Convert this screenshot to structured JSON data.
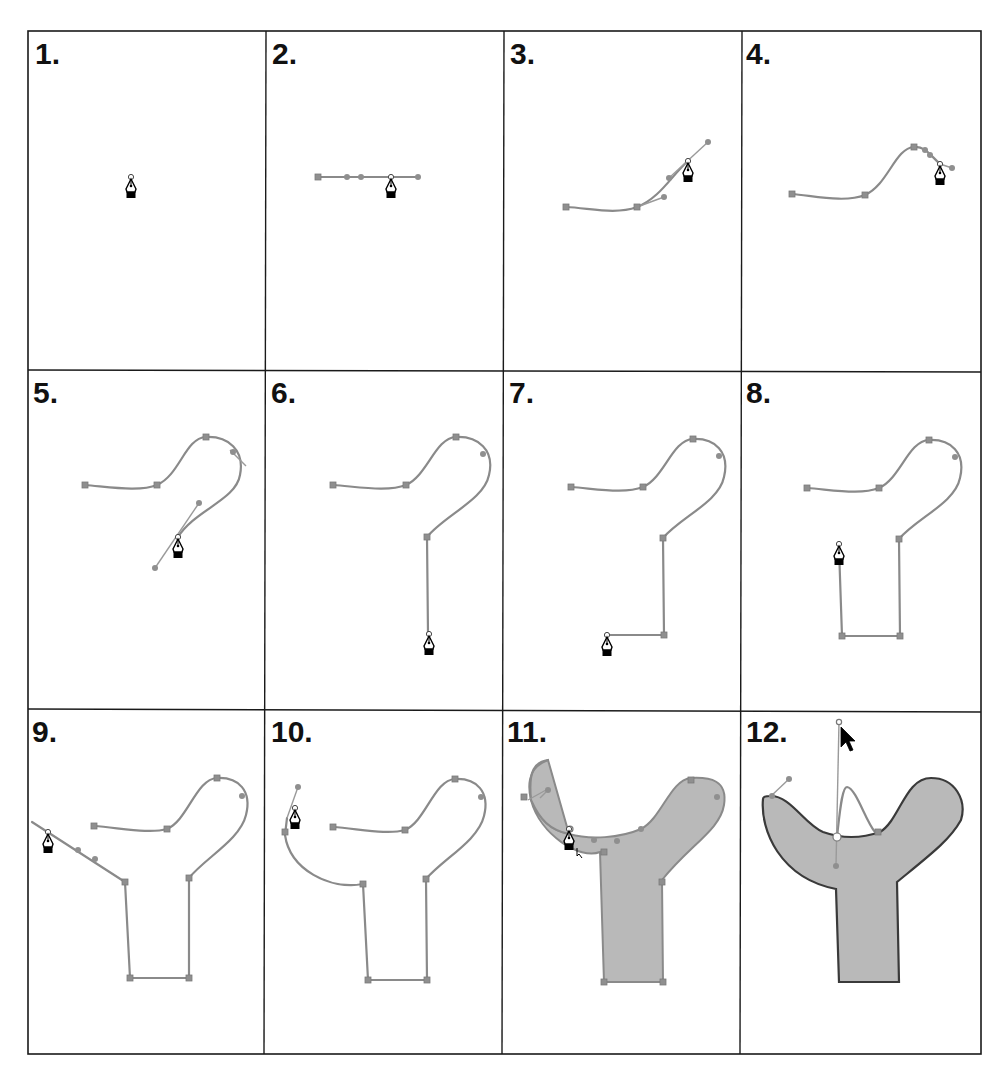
{
  "figure": {
    "grid": {
      "columns": 4,
      "rows": 3
    },
    "colors": {
      "frame": "#1a1a1a",
      "path_stroke": "#8a8a8a",
      "anchor": "#8f8f8f",
      "shape_fill": "#b9b9b9",
      "final_outline": "#3a3a3a",
      "background": "#ffffff"
    },
    "panels": [
      {
        "label": "1.",
        "step": 1,
        "tool": "pen-tool-cursor"
      },
      {
        "label": "2.",
        "step": 2,
        "tool": "pen-tool-cursor"
      },
      {
        "label": "3.",
        "step": 3,
        "tool": "pen-tool-cursor"
      },
      {
        "label": "4.",
        "step": 4,
        "tool": "pen-tool-cursor"
      },
      {
        "label": "5.",
        "step": 5,
        "tool": "pen-tool-cursor"
      },
      {
        "label": "6.",
        "step": 6,
        "tool": "pen-tool-cursor"
      },
      {
        "label": "7.",
        "step": 7,
        "tool": "pen-tool-cursor"
      },
      {
        "label": "8.",
        "step": 8,
        "tool": "pen-tool-cursor"
      },
      {
        "label": "9.",
        "step": 9,
        "tool": "pen-tool-cursor"
      },
      {
        "label": "10.",
        "step": 10,
        "tool": "pen-tool-cursor"
      },
      {
        "label": "11.",
        "step": 11,
        "tool": "pen-tool-close-path-cursor"
      },
      {
        "label": "12.",
        "step": 12,
        "tool": "arrow-selection-cursor"
      }
    ]
  }
}
